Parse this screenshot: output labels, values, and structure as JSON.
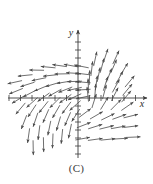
{
  "figure": {
    "caption": "(C)",
    "type": "direction-field",
    "background_color": "#ffffff",
    "ink_color": "#4a4a4a",
    "axis_color": "#3a3a3a"
  },
  "axes": {
    "x_label": "x",
    "y_label": "y",
    "origin_px": [
      78,
      98
    ],
    "x_axis_span_px": [
      8,
      147
    ],
    "y_axis_span_px": [
      30,
      158
    ],
    "x_tick_spacing_px": 11.5,
    "y_tick_spacing_px": 8,
    "x_tick_count": 12,
    "y_tick_count": 16,
    "tick_half_length_px": 3,
    "x_arrow": true,
    "y_arrow": true
  },
  "chart_data": {
    "type": "scatter",
    "title": "",
    "subtitle": "",
    "xlabel": "x",
    "ylabel": "y",
    "xlim": [
      -6.1,
      6.0
    ],
    "ylim": [
      -8.5,
      8.5
    ],
    "grid": false,
    "legend": null,
    "field_vectors": [
      {
        "x": -5.5,
        "y": 2.1,
        "dx": -1.0,
        "dy": -0.22
      },
      {
        "x": -4.6,
        "y": 3.0,
        "dx": -1.0,
        "dy": -0.1
      },
      {
        "x": -3.6,
        "y": 3.7,
        "dx": -1.0,
        "dy": 0.02
      },
      {
        "x": -2.6,
        "y": 4.1,
        "dx": -1.0,
        "dy": 0.1
      },
      {
        "x": -1.6,
        "y": 4.3,
        "dx": -1.0,
        "dy": 0.14
      },
      {
        "x": -0.6,
        "y": 4.3,
        "dx": -1.0,
        "dy": 0.18
      },
      {
        "x": 0.3,
        "y": 4.2,
        "dx": -1.0,
        "dy": 0.2
      },
      {
        "x": -5.4,
        "y": 0.9,
        "dx": -0.93,
        "dy": -0.38
      },
      {
        "x": -4.4,
        "y": 1.8,
        "dx": -0.95,
        "dy": -0.3
      },
      {
        "x": -3.4,
        "y": 2.5,
        "dx": -0.97,
        "dy": -0.2
      },
      {
        "x": -2.4,
        "y": 3.0,
        "dx": -0.99,
        "dy": -0.1
      },
      {
        "x": -1.4,
        "y": 3.2,
        "dx": -1.0,
        "dy": -0.02
      },
      {
        "x": -0.4,
        "y": 3.3,
        "dx": -1.0,
        "dy": 0.06
      },
      {
        "x": 0.4,
        "y": 3.2,
        "dx": -1.0,
        "dy": 0.12
      },
      {
        "x": -5.2,
        "y": -0.2,
        "dx": -0.85,
        "dy": -0.52
      },
      {
        "x": -4.2,
        "y": 0.6,
        "dx": -0.88,
        "dy": -0.46
      },
      {
        "x": -3.2,
        "y": 1.3,
        "dx": -0.92,
        "dy": -0.38
      },
      {
        "x": -2.2,
        "y": 1.8,
        "dx": -0.95,
        "dy": -0.28
      },
      {
        "x": -1.2,
        "y": 2.1,
        "dx": -0.98,
        "dy": -0.16
      },
      {
        "x": -0.3,
        "y": 2.2,
        "dx": -1.0,
        "dy": -0.04
      },
      {
        "x": 0.45,
        "y": 2.1,
        "dx": -1.0,
        "dy": 0.08
      },
      {
        "x": -4.0,
        "y": -0.6,
        "dx": -0.74,
        "dy": -0.66
      },
      {
        "x": -3.0,
        "y": 0.1,
        "dx": -0.8,
        "dy": -0.58
      },
      {
        "x": -2.0,
        "y": 0.7,
        "dx": -0.86,
        "dy": -0.48
      },
      {
        "x": -1.1,
        "y": 1.1,
        "dx": -0.92,
        "dy": -0.36
      },
      {
        "x": -0.3,
        "y": 1.2,
        "dx": -0.97,
        "dy": -0.22
      },
      {
        "x": 0.45,
        "y": 1.1,
        "dx": -1.0,
        "dy": -0.06
      },
      {
        "x": -5.0,
        "y": -1.4,
        "dx": -0.64,
        "dy": -0.76
      },
      {
        "x": -4.0,
        "y": -1.7,
        "dx": -0.55,
        "dy": -0.83
      },
      {
        "x": -3.0,
        "y": -1.2,
        "dx": -0.62,
        "dy": -0.78
      },
      {
        "x": -2.0,
        "y": -0.6,
        "dx": -0.7,
        "dy": -0.7
      },
      {
        "x": -1.1,
        "y": -0.1,
        "dx": -0.8,
        "dy": -0.58
      },
      {
        "x": -0.3,
        "y": 0.15,
        "dx": -0.9,
        "dy": -0.42
      },
      {
        "x": 0.45,
        "y": 0.1,
        "dx": -0.97,
        "dy": -0.22
      },
      {
        "x": -4.7,
        "y": -3.2,
        "dx": -0.36,
        "dy": -0.93
      },
      {
        "x": -3.7,
        "y": -2.9,
        "dx": -0.32,
        "dy": -0.95
      },
      {
        "x": -2.8,
        "y": -2.4,
        "dx": -0.4,
        "dy": -0.92
      },
      {
        "x": -1.9,
        "y": -1.8,
        "dx": -0.5,
        "dy": -0.86
      },
      {
        "x": -1.0,
        "y": -1.3,
        "dx": -0.6,
        "dy": -0.8
      },
      {
        "x": -0.25,
        "y": -1.0,
        "dx": -0.74,
        "dy": -0.66
      },
      {
        "x": -4.3,
        "y": -5.0,
        "dx": -0.14,
        "dy": -0.99
      },
      {
        "x": -3.4,
        "y": -4.6,
        "dx": -0.12,
        "dy": -0.99
      },
      {
        "x": -2.5,
        "y": -4.0,
        "dx": -0.2,
        "dy": -0.98
      },
      {
        "x": -1.7,
        "y": -3.4,
        "dx": -0.28,
        "dy": -0.96
      },
      {
        "x": -0.9,
        "y": -2.8,
        "dx": -0.4,
        "dy": -0.92
      },
      {
        "x": -0.2,
        "y": -2.3,
        "dx": -0.54,
        "dy": -0.84
      },
      {
        "x": -3.9,
        "y": -6.6,
        "dx": 0.02,
        "dy": -1.0
      },
      {
        "x": -3.0,
        "y": -6.2,
        "dx": 0.02,
        "dy": -1.0
      },
      {
        "x": -2.2,
        "y": -5.7,
        "dx": -0.04,
        "dy": -1.0
      },
      {
        "x": -1.4,
        "y": -5.1,
        "dx": -0.1,
        "dy": -0.99
      },
      {
        "x": -0.7,
        "y": -4.4,
        "dx": -0.2,
        "dy": -0.98
      },
      {
        "x": 1.5,
        "y": 5.2,
        "dx": 0.22,
        "dy": 1.0
      },
      {
        "x": 2.4,
        "y": 5.6,
        "dx": 0.32,
        "dy": 0.95
      },
      {
        "x": 3.3,
        "y": 5.4,
        "dx": 0.42,
        "dy": 0.91
      },
      {
        "x": 1.2,
        "y": 3.9,
        "dx": 0.12,
        "dy": 1.0
      },
      {
        "x": 2.1,
        "y": 4.3,
        "dx": 0.26,
        "dy": 0.97
      },
      {
        "x": 3.1,
        "y": 4.2,
        "dx": 0.4,
        "dy": 0.92
      },
      {
        "x": 4.0,
        "y": 3.8,
        "dx": 0.52,
        "dy": 0.85
      },
      {
        "x": 1.0,
        "y": 2.7,
        "dx": 0.04,
        "dy": 1.0
      },
      {
        "x": 1.8,
        "y": 3.1,
        "dx": 0.2,
        "dy": 0.98
      },
      {
        "x": 2.7,
        "y": 3.0,
        "dx": 0.36,
        "dy": 0.93
      },
      {
        "x": 3.6,
        "y": 2.7,
        "dx": 0.5,
        "dy": 0.87
      },
      {
        "x": 4.5,
        "y": 2.2,
        "dx": 0.64,
        "dy": 0.77
      },
      {
        "x": 0.9,
        "y": 1.6,
        "dx": -0.04,
        "dy": 1.0
      },
      {
        "x": 1.6,
        "y": 2.0,
        "dx": 0.14,
        "dy": 0.99
      },
      {
        "x": 2.4,
        "y": 1.9,
        "dx": 0.3,
        "dy": 0.95
      },
      {
        "x": 3.3,
        "y": 1.6,
        "dx": 0.48,
        "dy": 0.88
      },
      {
        "x": 4.3,
        "y": 1.1,
        "dx": 0.64,
        "dy": 0.77
      },
      {
        "x": 0.85,
        "y": 0.5,
        "dx": -0.1,
        "dy": 0.99
      },
      {
        "x": 1.5,
        "y": 0.9,
        "dx": 0.08,
        "dy": 1.0
      },
      {
        "x": 2.3,
        "y": 0.8,
        "dx": 0.26,
        "dy": 0.97
      },
      {
        "x": 3.2,
        "y": 0.5,
        "dx": 0.46,
        "dy": 0.89
      },
      {
        "x": 4.2,
        "y": 0.2,
        "dx": 0.64,
        "dy": 0.77
      },
      {
        "x": 1.4,
        "y": -0.4,
        "dx": 0.3,
        "dy": 0.95
      },
      {
        "x": 2.3,
        "y": -0.7,
        "dx": 0.52,
        "dy": 0.85
      },
      {
        "x": 3.3,
        "y": -0.9,
        "dx": 0.7,
        "dy": 0.71
      },
      {
        "x": 4.3,
        "y": -1.1,
        "dx": 0.82,
        "dy": 0.57
      },
      {
        "x": 0.6,
        "y": -2.0,
        "dx": 0.8,
        "dy": 0.6
      },
      {
        "x": 1.6,
        "y": -2.3,
        "dx": 0.86,
        "dy": 0.5
      },
      {
        "x": 2.6,
        "y": -2.5,
        "dx": 0.9,
        "dy": 0.44
      },
      {
        "x": 3.6,
        "y": -2.5,
        "dx": 0.94,
        "dy": 0.34
      },
      {
        "x": 4.6,
        "y": -2.4,
        "dx": 0.97,
        "dy": 0.24
      },
      {
        "x": 0.5,
        "y": -3.6,
        "dx": 0.93,
        "dy": 0.36
      },
      {
        "x": 1.5,
        "y": -3.8,
        "dx": 0.95,
        "dy": 0.3
      },
      {
        "x": 2.5,
        "y": -3.9,
        "dx": 0.97,
        "dy": 0.24
      },
      {
        "x": 3.5,
        "y": -3.9,
        "dx": 0.98,
        "dy": 0.18
      },
      {
        "x": 4.6,
        "y": -3.8,
        "dx": 0.99,
        "dy": 0.12
      },
      {
        "x": 0.4,
        "y": -5.4,
        "dx": 0.98,
        "dy": 0.18
      },
      {
        "x": 1.5,
        "y": -5.5,
        "dx": 0.99,
        "dy": 0.14
      },
      {
        "x": 2.6,
        "y": -5.5,
        "dx": 0.99,
        "dy": 0.1
      },
      {
        "x": 3.7,
        "y": -5.4,
        "dx": 1.0,
        "dy": 0.06
      },
      {
        "x": 4.8,
        "y": -5.2,
        "dx": 1.0,
        "dy": 0.04
      }
    ],
    "arrow_length_px": 14
  }
}
